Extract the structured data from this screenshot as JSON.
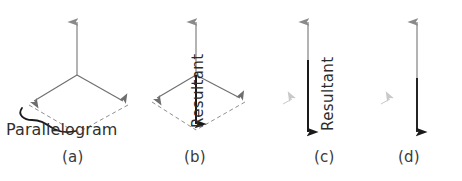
{
  "figure": {
    "width": 462,
    "height": 181,
    "background": "#ffffff"
  },
  "colors": {
    "component_vector": "#8a8a8a",
    "parallelogram_solid": "#6e6e6e",
    "parallelogram_dashed": "#8f8f8f",
    "resultant": "#1a1a1a",
    "brace": "#1a1a1a",
    "caption_text": "#3a3a3a",
    "label_text": "#2f2f2f",
    "ghost_artifact": "#c9c9c9"
  },
  "panels": [
    {
      "id": "a",
      "caption": "(a)",
      "caption_x": 62,
      "caption_y": 155,
      "annotation": "Parallelogram",
      "annotation_x": 6,
      "annotation_y": 131,
      "has_parallelogram": true,
      "has_resultant": false,
      "has_brace": true,
      "resultant_label": ""
    },
    {
      "id": "b",
      "caption": "(b)",
      "caption_x": 184,
      "caption_y": 155,
      "annotation": "",
      "has_parallelogram": true,
      "has_resultant": true,
      "has_brace": false,
      "resultant_label": "Resultant",
      "resultant_label_x": 189,
      "resultant_label_y": 128
    },
    {
      "id": "c",
      "caption": "(c)",
      "caption_x": 314,
      "caption_y": 155,
      "annotation": "",
      "has_parallelogram": false,
      "has_resultant": true,
      "has_brace": false,
      "resultant_label": "Resultant",
      "resultant_label_x": 319,
      "resultant_label_y": 131
    },
    {
      "id": "d",
      "caption": "(d)",
      "caption_x": 398,
      "caption_y": 155,
      "annotation": "",
      "has_parallelogram": false,
      "has_resultant": true,
      "has_brace": false,
      "resultant_label": ""
    }
  ],
  "geometry": {
    "panel_a": {
      "apex": [
        77,
        75
      ],
      "up_arrow_tip": [
        77,
        16
      ],
      "left_vertex": [
        29,
        104
      ],
      "right_vertex": [
        128,
        104
      ],
      "bottom_vertex": [
        77,
        133
      ]
    },
    "panel_b": {
      "apex": [
        196,
        75
      ],
      "up_arrow_tip": [
        196,
        16
      ],
      "left_vertex": [
        152,
        101
      ],
      "right_vertex": [
        245,
        101
      ],
      "bottom_vertex": [
        196,
        130
      ]
    },
    "panel_c": {
      "axis_x": 308,
      "up_arrow_tip": [
        308,
        16
      ],
      "origin": [
        308,
        75
      ],
      "down_arrow_tip": [
        308,
        138
      ],
      "ghost_arrow": [
        290,
        101
      ]
    },
    "panel_d": {
      "axis_x": 417,
      "up_arrow_tip": [
        417,
        16
      ],
      "split": [
        417,
        78
      ],
      "down_arrow_tip": [
        417,
        138
      ],
      "ghost_arrow": [
        388,
        101
      ]
    }
  }
}
